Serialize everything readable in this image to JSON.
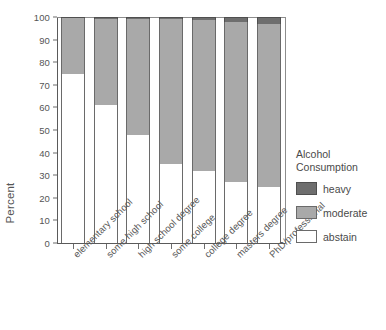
{
  "chart_data": {
    "type": "bar",
    "stacked": true,
    "title": "",
    "xlabel": "",
    "ylabel": "Percent",
    "ylim": [
      0,
      100
    ],
    "ytick_step": 10,
    "ytick_labels": [
      "100",
      "90",
      "80",
      "70",
      "60",
      "50",
      "40",
      "30",
      "20",
      "10",
      "0"
    ],
    "grid": false,
    "legend_position": "right",
    "legend_title": "Alcohol Consumption",
    "categories": [
      "elementary school",
      "some high school",
      "high school degree",
      "some college",
      "college degree",
      "masters degree",
      "PhD/professional"
    ],
    "series": [
      {
        "name": "abstain",
        "color": "#ffffff",
        "values": [
          75,
          61,
          48,
          35,
          32,
          27,
          25
        ]
      },
      {
        "name": "moderate",
        "color": "#a9a9a9",
        "values": [
          24.5,
          38.3,
          51,
          64,
          66.5,
          71,
          72
        ]
      },
      {
        "name": "heavy",
        "color": "#6e6e6e",
        "values": [
          0.5,
          0.7,
          1,
          1,
          1.5,
          2,
          3
        ]
      }
    ]
  },
  "axes": {
    "y_title": "Percent"
  },
  "legend": {
    "title_line1": "Alcohol",
    "title_line2": "Consumption",
    "items": [
      {
        "label": "heavy",
        "key": "heavy"
      },
      {
        "label": "moderate",
        "key": "moderate"
      },
      {
        "label": "abstain",
        "key": "abstain"
      }
    ]
  },
  "colors": {
    "heavy": "#6e6e6e",
    "moderate": "#a9a9a9",
    "abstain": "#ffffff",
    "axis": "#5a5a5a",
    "text": "#4a4a4a"
  }
}
